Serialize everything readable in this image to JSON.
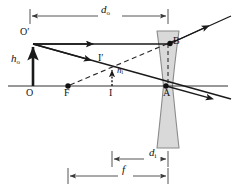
{
  "figure": {
    "width": 235,
    "height": 190,
    "background": "#ffffff"
  },
  "colors": {
    "ink": "#111111",
    "ray": "#1a1a1a",
    "dim_line": "#555555",
    "lens_fill": "#d9d9d9",
    "lens_stroke": "#8a8a8a",
    "axis": "#333333"
  },
  "labels": {
    "d_o": {
      "text": "d",
      "sub": "o",
      "x": 104,
      "y": 8
    },
    "d_i": {
      "text": "d",
      "sub": "i",
      "x": 152,
      "y": 152
    },
    "f": {
      "text": "f",
      "sub": "",
      "x": 124,
      "y": 170
    },
    "h_o": {
      "text": "h",
      "sub": "o",
      "x": 13,
      "y": 58
    },
    "h_i": {
      "text": "h",
      "sub": "i",
      "x": 116,
      "y": 71
    },
    "O_prime": {
      "text": "O′",
      "x": 22,
      "y": 32
    },
    "I_prime": {
      "text": "I′",
      "x": 99,
      "y": 58
    },
    "O": {
      "text": "O",
      "x": 26,
      "y": 90
    },
    "F": {
      "text": "F",
      "x": 65,
      "y": 90
    },
    "I": {
      "text": "I",
      "x": 110,
      "y": 90
    },
    "A": {
      "text": "A",
      "x": 166,
      "y": 89
    },
    "B": {
      "text": "B",
      "x": 176,
      "y": 32
    }
  },
  "points": {
    "O": {
      "x": 30,
      "y": 86,
      "dot": false
    },
    "F": {
      "x": 68,
      "y": 86,
      "dot": true
    },
    "I": {
      "x": 112,
      "y": 86,
      "dot": false
    },
    "A": {
      "x": 166,
      "y": 86,
      "dot": true
    },
    "B": {
      "x": 172,
      "y": 42,
      "dot": true
    },
    "O_prime": {
      "x": 33,
      "y": 44,
      "dot": false
    },
    "I_prime": {
      "x": 112,
      "y": 67,
      "dot": false
    }
  },
  "geometry": {
    "axis": {
      "x1": 8,
      "y1": 86,
      "x2": 228,
      "y2": 86
    },
    "lens": {
      "center_x": 168,
      "top_y": 31,
      "bottom_y": 148,
      "top_half_width": 11,
      "waist_half_width": 4.5,
      "bottom_half_width": 11
    },
    "rays": [
      {
        "name": "parallel-ray-incident",
        "from": [
          33,
          44
        ],
        "to": [
          168,
          44
        ]
      },
      {
        "name": "parallel-ray-refracted",
        "from": [
          168,
          44
        ],
        "to": [
          228,
          18
        ]
      },
      {
        "name": "center-ray",
        "from": [
          33,
          44
        ],
        "to": [
          228,
          98
        ]
      }
    ],
    "virtual_rays": [
      {
        "name": "focal-dashed-extension",
        "from": [
          72,
          84
        ],
        "to": [
          175,
          41
        ]
      },
      {
        "name": "lens-axis-dashed",
        "from": [
          168,
          43
        ],
        "to": [
          168,
          86
        ]
      }
    ],
    "dimension_lines": [
      {
        "name": "d-o-dimension",
        "y": 16,
        "x1": 30,
        "x2": 168
      },
      {
        "name": "d-i-dimension",
        "y": 159,
        "x1": 112,
        "x2": 168
      },
      {
        "name": "f-dimension",
        "y": 176,
        "x1": 68,
        "x2": 168
      }
    ]
  },
  "description": {
    "object_arrow": "h-o object arrow from O up to O-prime",
    "image_arrow": "h-i dotted image arrow from I up to I-prime",
    "lens_type": "diverging-concave-lens"
  }
}
